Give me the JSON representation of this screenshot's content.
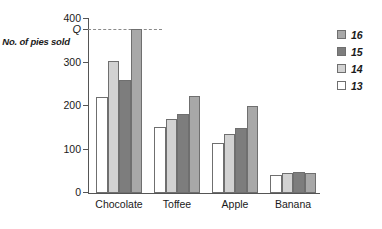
{
  "chart_data": {
    "type": "bar",
    "title": "",
    "xlabel": "",
    "ylabel": "No. of pies sold",
    "categories": [
      "Chocolate",
      "Toffee",
      "Apple",
      "Banana"
    ],
    "series": [
      {
        "name": "13",
        "color": "#ffffff",
        "values": [
          220,
          150,
          115,
          40
        ]
      },
      {
        "name": "14",
        "color": "#d2d2d2",
        "values": [
          302,
          170,
          135,
          45
        ]
      },
      {
        "name": "15",
        "color": "#7d7d7d",
        "values": [
          260,
          180,
          148,
          48
        ]
      },
      {
        "name": "16",
        "color": "#a8a8a8",
        "values": [
          375,
          222,
          200,
          45
        ]
      }
    ],
    "ylim": [
      0,
      400
    ],
    "yticks": [
      0,
      100,
      200,
      300,
      400
    ],
    "ytick_labels": [
      "0",
      "100",
      "200",
      "300",
      "400"
    ],
    "grid": false,
    "legend_position": "right",
    "legend_order": [
      "16",
      "15",
      "14",
      "13"
    ],
    "annotations": [
      {
        "label": "Q",
        "axis": "y",
        "value": 375,
        "style": "dashed-line"
      }
    ]
  },
  "legend": {
    "items": [
      {
        "label": "16",
        "color": "#a8a8a8"
      },
      {
        "label": "15",
        "color": "#7d7d7d"
      },
      {
        "label": "14",
        "color": "#d2d2d2"
      },
      {
        "label": "13",
        "color": "#ffffff"
      }
    ]
  }
}
